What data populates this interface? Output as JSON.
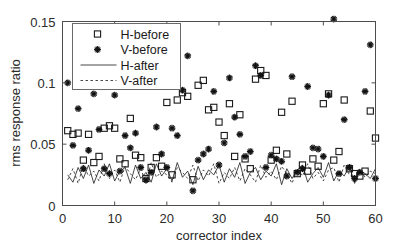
{
  "chart_data": {
    "type": "scatter",
    "title": "",
    "xlabel": "corrector index",
    "ylabel": "rms response ratio",
    "xlim": [
      0,
      60
    ],
    "ylim": [
      0,
      0.15
    ],
    "xticks": [
      0,
      10,
      20,
      30,
      40,
      50,
      60
    ],
    "xticklabels": [
      "0",
      "10",
      "20",
      "30",
      "40",
      "50",
      "60"
    ],
    "yticks": [
      0,
      0.05,
      0.1,
      0.15
    ],
    "yticklabels": [
      "0",
      "0.05",
      "0.1",
      "0.15"
    ],
    "grid": false,
    "legend_position": "upper left",
    "legend": [
      {
        "label": "H-before",
        "style": "square-marker"
      },
      {
        "label": "V-before",
        "style": "star-marker"
      },
      {
        "label": "H-after",
        "style": "solid-line"
      },
      {
        "label": "V-after",
        "style": "dashed-line"
      }
    ],
    "x": [
      1,
      2,
      3,
      4,
      5,
      6,
      7,
      8,
      9,
      10,
      11,
      12,
      13,
      14,
      15,
      16,
      17,
      18,
      19,
      20,
      21,
      22,
      23,
      24,
      25,
      26,
      27,
      28,
      29,
      30,
      31,
      32,
      33,
      34,
      35,
      36,
      37,
      38,
      39,
      40,
      41,
      42,
      43,
      44,
      45,
      46,
      47,
      48,
      49,
      50,
      51,
      52,
      53,
      54,
      55,
      56,
      57,
      58,
      59,
      60
    ],
    "series": [
      {
        "name": "H-before",
        "marker": "square",
        "values": [
          0.061,
          0.058,
          0.059,
          0.037,
          0.058,
          0.035,
          0.04,
          0.063,
          0.065,
          0.063,
          0.038,
          0.034,
          0.071,
          0.041,
          0.039,
          0.022,
          0.031,
          0.039,
          0.032,
          0.084,
          0.025,
          0.086,
          0.092,
          0.089,
          0.021,
          0.098,
          0.102,
          0.078,
          0.08,
          0.068,
          0.057,
          0.083,
          0.04,
          0.074,
          0.038,
          0.03,
          0.103,
          0.11,
          0.106,
          0.037,
          0.045,
          0.076,
          0.042,
          0.085,
          0.026,
          0.033,
          0.028,
          0.038,
          0.032,
          0.083,
          0.091,
          0.037,
          0.044,
          0.086,
          0.03,
          0.026,
          0.024,
          0.028,
          0.077,
          0.055
        ]
      },
      {
        "name": "V-before",
        "marker": "star",
        "values": [
          0.1,
          0.049,
          0.079,
          0.03,
          0.045,
          0.091,
          0.062,
          0.03,
          0.026,
          0.09,
          0.028,
          0.057,
          0.047,
          0.059,
          0.031,
          0.021,
          0.027,
          0.064,
          0.042,
          0.031,
          0.063,
          0.057,
          0.094,
          0.122,
          0.012,
          0.037,
          0.042,
          0.046,
          0.093,
          0.033,
          0.051,
          0.104,
          0.072,
          0.058,
          0.04,
          0.044,
          0.114,
          0.106,
          0.031,
          0.041,
          0.038,
          0.036,
          0.024,
          0.105,
          0.027,
          0.03,
          0.097,
          0.047,
          0.046,
          0.04,
          0.09,
          0.152,
          0.026,
          0.07,
          0.031,
          0.022,
          0.027,
          0.093,
          0.131,
          0.022
        ]
      },
      {
        "name": "H-after",
        "line": "solid",
        "values": [
          0.025,
          0.019,
          0.031,
          0.022,
          0.033,
          0.018,
          0.029,
          0.024,
          0.034,
          0.02,
          0.028,
          0.031,
          0.018,
          0.033,
          0.022,
          0.027,
          0.019,
          0.034,
          0.024,
          0.03,
          0.02,
          0.035,
          0.023,
          0.028,
          0.017,
          0.032,
          0.021,
          0.029,
          0.025,
          0.033,
          0.019,
          0.03,
          0.023,
          0.035,
          0.018,
          0.027,
          0.031,
          0.021,
          0.028,
          0.024,
          0.034,
          0.017,
          0.03,
          0.022,
          0.029,
          0.033,
          0.019,
          0.026,
          0.031,
          0.023,
          0.035,
          0.02,
          0.028,
          0.024,
          0.032,
          0.018,
          0.029,
          0.026,
          0.022,
          0.03
        ]
      },
      {
        "name": "V-after",
        "line": "dashed",
        "values": [
          0.021,
          0.03,
          0.018,
          0.033,
          0.024,
          0.028,
          0.02,
          0.034,
          0.022,
          0.029,
          0.019,
          0.032,
          0.026,
          0.021,
          0.03,
          0.018,
          0.035,
          0.023,
          0.028,
          0.025,
          0.019,
          0.031,
          0.027,
          0.022,
          0.033,
          0.02,
          0.029,
          0.024,
          0.034,
          0.018,
          0.027,
          0.022,
          0.031,
          0.02,
          0.03,
          0.025,
          0.019,
          0.033,
          0.023,
          0.028,
          0.021,
          0.032,
          0.026,
          0.018,
          0.03,
          0.024,
          0.034,
          0.022,
          0.027,
          0.02,
          0.029,
          0.031,
          0.019,
          0.033,
          0.025,
          0.021,
          0.03,
          0.023,
          0.028,
          0.026
        ]
      }
    ]
  }
}
